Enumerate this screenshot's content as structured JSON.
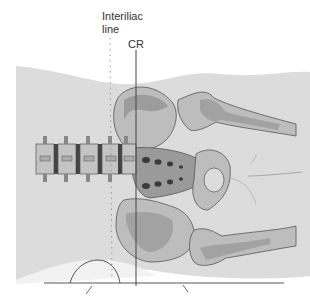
{
  "diagram": {
    "labels": {
      "interiliac_line": "Interiliac\nline",
      "central_ray": "CR"
    },
    "colors": {
      "background": "#ffffff",
      "body_fill": "#dcdcdc",
      "bone_light": "#bdbdbd",
      "bone_dark": "#8f8f8f",
      "outline": "#555555",
      "foramina": "#3a3a3a",
      "cr_line": "#444444",
      "interiliac_dots": "#999999"
    },
    "elements": [
      "soft-tissue body outline",
      "lumbar vertebrae (5)",
      "sacrum with foramina",
      "left ilium",
      "right ilium",
      "femoral heads and proximal femurs",
      "interiliac dotted line",
      "central ray vertical line",
      "table line",
      "sponge/positioning support"
    ]
  }
}
